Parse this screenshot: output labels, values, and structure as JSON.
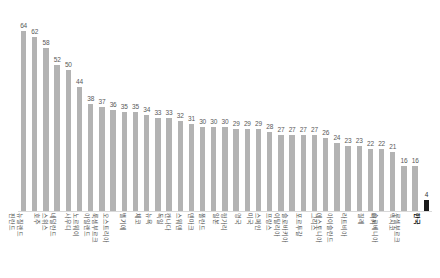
{
  "chart_data": {
    "type": "bar",
    "title": "",
    "subtitle": "",
    "xlabel": "",
    "ylabel": "",
    "ylim": [
      0,
      70
    ],
    "grid": false,
    "legend": false,
    "highlight_category": "한국",
    "highlight_color": "#1a1a1a",
    "bar_color": "#b3b3b3",
    "categories": [
      "핀란드",
      "뉴질랜드",
      "호주",
      "스위스",
      "네덜란드",
      "사우디",
      "노르웨이",
      "아일랜드",
      "룩셈부르크",
      "오스트리아",
      "벨기에",
      "체코",
      "뉴욕",
      "독일",
      "캔나다",
      "스웨덴",
      "덴마크",
      "폴란드",
      "일본",
      "헝가리",
      "영국",
      "미국",
      "스페인",
      "프랑스",
      "이탈리아",
      "슬로바키아",
      "포르투갈",
      "그리스",
      "에스토니아",
      "아이슬란드",
      "라트비아",
      "칠레",
      "터키",
      "슬로베니아",
      "멕시코",
      "루셀부르크",
      "한국"
    ],
    "values": [
      64,
      62,
      58,
      52,
      50,
      44,
      38,
      37,
      36,
      35,
      35,
      34,
      33,
      33,
      32,
      31,
      30,
      30,
      30,
      29,
      29,
      29,
      28,
      27,
      27,
      27,
      27,
      26,
      24,
      23,
      23,
      22,
      22,
      21,
      16,
      16,
      4
    ],
    "value_labels": [
      "64",
      "62",
      "58",
      "52",
      "50",
      "44",
      "38",
      "37",
      "36",
      "35",
      "35",
      "34",
      "33",
      "33",
      "32",
      "31",
      "30",
      "30",
      "30",
      "29",
      "29",
      "29",
      "28",
      "27",
      "27",
      "27",
      "27",
      "26",
      "24",
      "23",
      "23",
      "22",
      "22",
      "21",
      "16",
      "16",
      "4"
    ]
  }
}
